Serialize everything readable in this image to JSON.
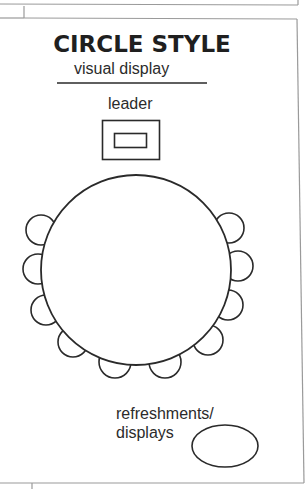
{
  "diagram": {
    "title": "CIRCLE STYLE",
    "subtitle": "visual display",
    "leader_label": "leader",
    "refreshments_label_line1": "refreshments/",
    "refreshments_label_line2": "displays",
    "stroke_color": "#2a2a2a",
    "border_color": "#9a9a9a",
    "table": {
      "shape": "circle",
      "center": [
        136,
        270
      ],
      "radius": 95
    },
    "chair_count": 10,
    "chairs": [
      {
        "position": "left-1",
        "center": [
          41,
          230
        ]
      },
      {
        "position": "left-2",
        "center": [
          38,
          269
        ]
      },
      {
        "position": "left-3",
        "center": [
          46,
          310
        ]
      },
      {
        "position": "left-4",
        "center": [
          73,
          342
        ]
      },
      {
        "position": "bottom-1",
        "center": [
          115,
          362
        ]
      },
      {
        "position": "bottom-2",
        "center": [
          165,
          362
        ]
      },
      {
        "position": "right-4",
        "center": [
          208,
          340
        ]
      },
      {
        "position": "right-3",
        "center": [
          228,
          305
        ]
      },
      {
        "position": "right-2",
        "center": [
          238,
          266
        ]
      },
      {
        "position": "right-1",
        "center": [
          229,
          228
        ]
      }
    ],
    "leader_station": {
      "shape": "nested-rectangles"
    },
    "refreshments_table": {
      "shape": "ellipse",
      "center": [
        225,
        446
      ],
      "rx": 33,
      "ry": 21
    }
  }
}
